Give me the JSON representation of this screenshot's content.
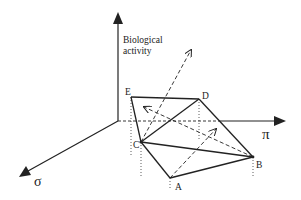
{
  "diagram": {
    "axes": {
      "vertical_label_line1": "Biological",
      "vertical_label_line2": "activity",
      "horizontal_label": "π",
      "depth_label": "σ"
    },
    "points": {
      "A": "A",
      "B": "B",
      "C": "C",
      "D": "D",
      "E": "E"
    },
    "colors": {
      "line": "#222222",
      "background": "#ffffff"
    }
  }
}
